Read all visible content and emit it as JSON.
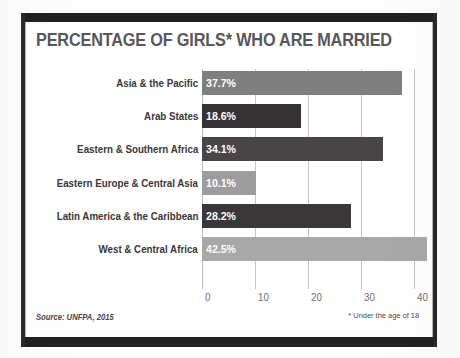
{
  "poster": {
    "title": "PERCENTAGE OF GIRLS* WHO ARE MARRIED",
    "source_note": "Source: UNFPA, 2015",
    "age_note": "* Under the age of 18",
    "title_color": "#58585a",
    "frame_color": "#221f1f"
  },
  "chart_data": {
    "type": "bar",
    "orientation": "horizontal",
    "title": "PERCENTAGE OF GIRLS* WHO ARE MARRIED",
    "xlabel": "",
    "ylabel": "",
    "xlim": [
      0,
      40
    ],
    "xticks": [
      0,
      10,
      20,
      30,
      40
    ],
    "xtick_labels": [
      "0",
      "10",
      "20",
      "30",
      "40"
    ],
    "grid": true,
    "legend": "none",
    "categories": [
      "Asia & the Pacific",
      "Arab States",
      "Eastern & Southern Africa",
      "Eastern Europe & Central Asia",
      "Latin America  & the Caribbean",
      "West & Central Africa"
    ],
    "values": [
      37.7,
      18.6,
      34.1,
      10.1,
      28.2,
      42.5
    ],
    "value_labels": [
      "37.7%",
      "18.6%",
      "34.1%",
      "10.1%",
      "28.2%",
      "42.5%"
    ],
    "bar_colors": [
      "#7f7f7f",
      "#363233",
      "#494546",
      "#9d9d9d",
      "#3b3738",
      "#a8a8a8"
    ],
    "annotations": [
      "* Under the age of 18"
    ],
    "source": "Source: UNFPA, 2015"
  }
}
